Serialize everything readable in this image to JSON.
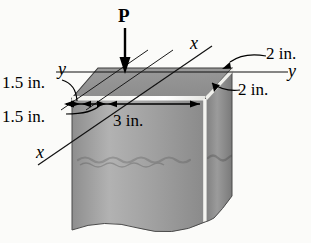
{
  "figure": {
    "background_color": "#fbfbf9",
    "ink_color": "#000000"
  },
  "load": {
    "label": "P",
    "arrow": "down-arrow"
  },
  "axes": [
    {
      "name": "x-axis-upper",
      "label": "x"
    },
    {
      "name": "x-axis-lower",
      "label": "x"
    },
    {
      "name": "y-axis-left",
      "label": "y"
    },
    {
      "name": "y-axis-right",
      "label": "y"
    }
  ],
  "dimensions": [
    {
      "name": "width-left-offset",
      "label": "1.5 in."
    },
    {
      "name": "width-left-second",
      "label": "1.5 in."
    },
    {
      "name": "width-front",
      "label": "3 in."
    },
    {
      "name": "depth-top",
      "label": "2 in."
    },
    {
      "name": "depth-bottom",
      "label": "2 in."
    }
  ],
  "solid": {
    "top_face_color": "#9a9a9a",
    "front_face_color": "#a8a8a8",
    "side_face_color": "#8a8a8a",
    "edge_highlight_color": "#f2f2ee"
  }
}
